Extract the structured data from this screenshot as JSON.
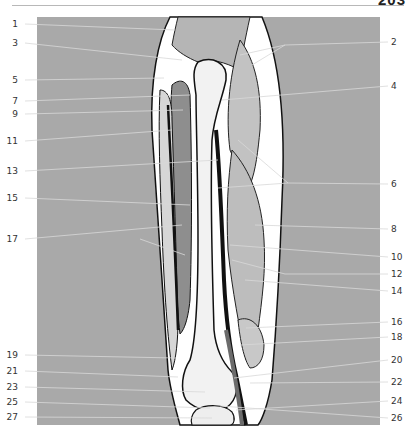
{
  "page": {
    "page_number": "203"
  },
  "figure": {
    "background_color": "#a9a9a9"
  },
  "labels_left": [
    {
      "num": "1",
      "y": 24
    },
    {
      "num": "3",
      "y": 43
    },
    {
      "num": "5",
      "y": 80
    },
    {
      "num": "7",
      "y": 101
    },
    {
      "num": "9",
      "y": 114
    },
    {
      "num": "11",
      "y": 141
    },
    {
      "num": "13",
      "y": 171
    },
    {
      "num": "15",
      "y": 198
    },
    {
      "num": "17",
      "y": 239
    },
    {
      "num": "19",
      "y": 355
    },
    {
      "num": "21",
      "y": 371
    },
    {
      "num": "23",
      "y": 387
    },
    {
      "num": "25",
      "y": 402
    },
    {
      "num": "27",
      "y": 417
    }
  ],
  "labels_right": [
    {
      "num": "2",
      "y": 42
    },
    {
      "num": "4",
      "y": 86
    },
    {
      "num": "6",
      "y": 184
    },
    {
      "num": "8",
      "y": 229
    },
    {
      "num": "10",
      "y": 257
    },
    {
      "num": "12",
      "y": 274
    },
    {
      "num": "14",
      "y": 291
    },
    {
      "num": "16",
      "y": 322
    },
    {
      "num": "18",
      "y": 337
    },
    {
      "num": "20",
      "y": 360
    },
    {
      "num": "22",
      "y": 382
    },
    {
      "num": "24",
      "y": 401
    },
    {
      "num": "26",
      "y": 418
    }
  ]
}
